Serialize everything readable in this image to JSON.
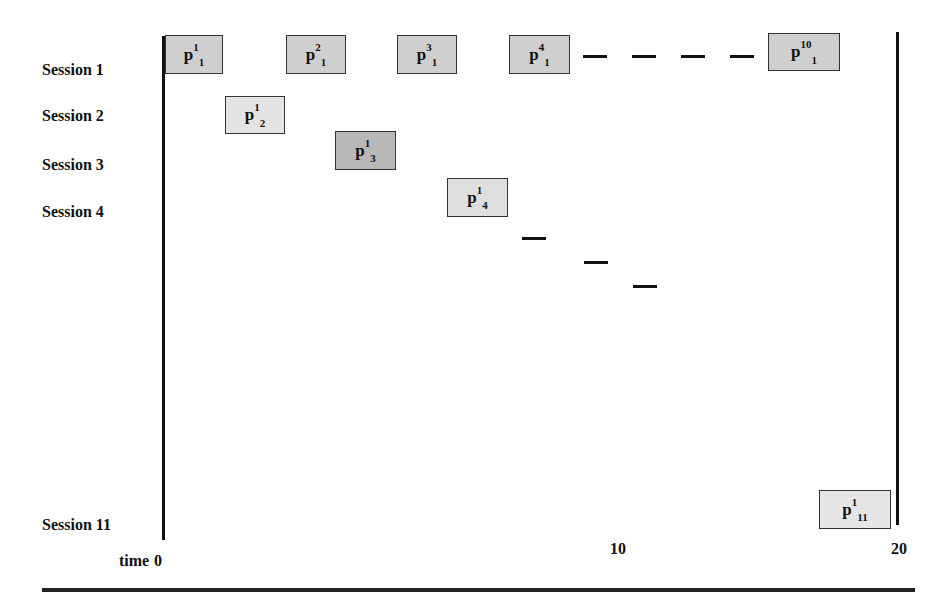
{
  "diagram": {
    "type": "session-timeline",
    "sessions": [
      {
        "label": "Session 1",
        "y": 70
      },
      {
        "label": "Session 2",
        "y": 116
      },
      {
        "label": "Session 3",
        "y": 165
      },
      {
        "label": "Session 4",
        "y": 212
      },
      {
        "label": "Session 11",
        "y": 525
      }
    ],
    "time_axis": {
      "label": "time",
      "ticks": [
        {
          "label": "0",
          "x": 158
        },
        {
          "label": "10",
          "x": 612
        },
        {
          "label": "20",
          "x": 893
        }
      ]
    },
    "blocks": [
      {
        "base": "p",
        "sup": "1",
        "sub": "1",
        "x": 165,
        "y": 35,
        "w": 58,
        "h": 39,
        "fill": "#cfcfcf"
      },
      {
        "base": "p",
        "sup": "2",
        "sub": "1",
        "x": 286,
        "y": 35,
        "w": 60,
        "h": 39,
        "fill": "#cfcfcf"
      },
      {
        "base": "p",
        "sup": "3",
        "sub": "1",
        "x": 397,
        "y": 35,
        "w": 60,
        "h": 39,
        "fill": "#cfcfcf"
      },
      {
        "base": "p",
        "sup": "4",
        "sub": "1",
        "x": 509,
        "y": 35,
        "w": 61,
        "h": 39,
        "fill": "#cfcfcf"
      },
      {
        "base": "p",
        "sup": "10",
        "sub": "1",
        "x": 768,
        "y": 33,
        "w": 72,
        "h": 38,
        "fill": "#cfcfcf"
      },
      {
        "base": "p",
        "sup": "1",
        "sub": "2",
        "x": 225,
        "y": 96,
        "w": 60,
        "h": 38,
        "fill": "#e4e4e4"
      },
      {
        "base": "p",
        "sup": "1",
        "sub": "3",
        "x": 335,
        "y": 131,
        "w": 61,
        "h": 39,
        "fill": "#b8b8b8"
      },
      {
        "base": "p",
        "sup": "1",
        "sub": "4",
        "x": 447,
        "y": 178,
        "w": 61,
        "h": 39,
        "fill": "#dedede"
      },
      {
        "base": "p",
        "sup": "1",
        "sub": "11",
        "x": 819,
        "y": 490,
        "w": 72,
        "h": 39,
        "fill": "#e6e6e6"
      }
    ],
    "dashes": [
      {
        "x": 583,
        "y": 55
      },
      {
        "x": 632,
        "y": 55
      },
      {
        "x": 681,
        "y": 55
      },
      {
        "x": 730,
        "y": 55
      },
      {
        "x": 522,
        "y": 237
      },
      {
        "x": 584,
        "y": 261
      },
      {
        "x": 633,
        "y": 285
      }
    ]
  }
}
